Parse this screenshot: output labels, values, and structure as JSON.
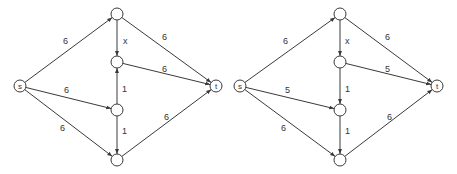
{
  "graphs": [
    {
      "id": "left",
      "nodes": [
        {
          "id": "s",
          "label": "s",
          "x": 20,
          "y": 86
        },
        {
          "id": "a",
          "label": "",
          "x": 117,
          "y": 14
        },
        {
          "id": "b",
          "label": "",
          "x": 117,
          "y": 62
        },
        {
          "id": "c",
          "label": "",
          "x": 117,
          "y": 110
        },
        {
          "id": "d",
          "label": "",
          "x": 117,
          "y": 160
        },
        {
          "id": "t",
          "label": "t",
          "x": 216,
          "y": 86
        }
      ],
      "edges": [
        {
          "from": "s",
          "to": "a",
          "label": "6",
          "lx": 63,
          "ly": 44
        },
        {
          "from": "s",
          "to": "c",
          "label": "6",
          "lx": 64,
          "ly": 93
        },
        {
          "from": "s",
          "to": "d",
          "label": "6",
          "lx": 60,
          "ly": 131
        },
        {
          "from": "a",
          "to": "b",
          "label": "x",
          "lx": 123,
          "ly": 44
        },
        {
          "from": "c",
          "to": "b",
          "label": "1",
          "lx": 122,
          "ly": 92
        },
        {
          "from": "c",
          "to": "d",
          "label": "1",
          "lx": 122,
          "ly": 134
        },
        {
          "from": "a",
          "to": "t",
          "label": "6",
          "lx": 162,
          "ly": 40
        },
        {
          "from": "b",
          "to": "t",
          "label": "6",
          "lx": 162,
          "ly": 72
        },
        {
          "from": "d",
          "to": "t",
          "label": "6",
          "lx": 164,
          "ly": 120
        }
      ]
    },
    {
      "id": "right",
      "nodes": [
        {
          "id": "s",
          "label": "s",
          "x": 240,
          "y": 86
        },
        {
          "id": "a",
          "label": "",
          "x": 340,
          "y": 14
        },
        {
          "id": "b",
          "label": "",
          "x": 340,
          "y": 62
        },
        {
          "id": "c",
          "label": "",
          "x": 340,
          "y": 110
        },
        {
          "id": "d",
          "label": "",
          "x": 340,
          "y": 160
        },
        {
          "id": "t",
          "label": "t",
          "x": 437,
          "y": 86
        }
      ],
      "edges": [
        {
          "from": "s",
          "to": "a",
          "label": "6",
          "lx": 283,
          "ly": 44
        },
        {
          "from": "s",
          "to": "c",
          "label": "5",
          "lx": 285,
          "ly": 93
        },
        {
          "from": "s",
          "to": "d",
          "label": "6",
          "lx": 281,
          "ly": 131
        },
        {
          "from": "a",
          "to": "b",
          "label": "x",
          "lx": 345,
          "ly": 44
        },
        {
          "from": "b",
          "to": "c",
          "label": "1",
          "lx": 345,
          "ly": 92
        },
        {
          "from": "c",
          "to": "d",
          "label": "1",
          "lx": 345,
          "ly": 134
        },
        {
          "from": "a",
          "to": "t",
          "label": "6",
          "lx": 385,
          "ly": 40
        },
        {
          "from": "b",
          "to": "t",
          "label": "5",
          "lx": 385,
          "ly": 72
        },
        {
          "from": "d",
          "to": "t",
          "label": "6",
          "lx": 387,
          "ly": 120
        }
      ]
    }
  ],
  "style": {
    "node_radius": 6,
    "stroke_color": "#3a3a3a",
    "background": "#ffffff"
  }
}
